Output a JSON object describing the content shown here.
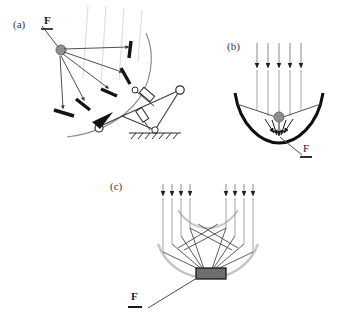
{
  "figure": {
    "background_color": "#ffffff",
    "panels": [
      {
        "id": "a",
        "label": "(a)",
        "caption_text": "(a)",
        "type": "tilted-faceted-dish-with-linkage",
        "focus_label": "F",
        "description": "Tilted segmented-facet concentrator on articulated support frame with ground mount",
        "elements": {
          "focal_node": "gray-disc",
          "reflector": "curved-arc",
          "facet_count": 5,
          "actuator_count": 2,
          "pivot_count": 3,
          "ground": "hatched-line",
          "incident_rays": 4
        }
      },
      {
        "id": "b",
        "label": "(b)",
        "caption_text": "(b)",
        "type": "parabolic-dish",
        "focus_label": "F",
        "description": "Parabolic dish concentrator, parallel vertical rays converging on a point focus",
        "elements": {
          "focal_node": "gray-disc",
          "reflector": "thick-parabola",
          "incident_rays": 5,
          "converging_rays": 5
        }
      },
      {
        "id": "c",
        "label": "(c)",
        "caption_text": "(c)",
        "type": "segmented-fresnel-concentrator",
        "focus_label": "F",
        "description": "Segmented faceted concentrator focusing two ray bundles onto a flat receiver block",
        "elements": {
          "receiver": "gray-rectangle",
          "reflector": "light-gray-arc",
          "facet_count": 8,
          "incident_rays_left": 4,
          "incident_rays_right": 4
        }
      }
    ],
    "colors": {
      "ray": "#6b6b6b",
      "faint_ray": "#d8d8d8",
      "mirror_dark": "#141414",
      "mirror_light": "#c8c8c8",
      "focal_node": "#8f8f8f",
      "receiver_fill": "#6e6e6e",
      "receiver_stroke": "#1a1a1a",
      "label": "#3a3a3a",
      "line": "#4a4a4a",
      "ground": "#2a2a2a"
    }
  }
}
